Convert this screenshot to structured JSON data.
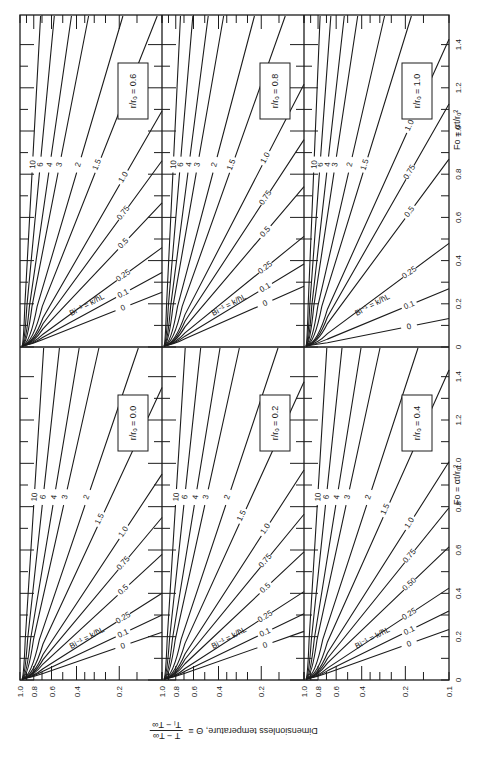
{
  "chart_data": {
    "type": "line",
    "xlabel": "Fo = αt/rₒ²",
    "ylabel": "Dimensionless temperature, Θ ≡ (T − T∞)/(Tᵢ − T∞)",
    "x_axis": {
      "label": "Fo = αt/rₒ²",
      "range": [
        0,
        1.4
      ],
      "ticks": [
        "0",
        "0.2",
        "0.4",
        "0.6",
        "0.8",
        "1.0",
        "1.2",
        "1.4"
      ]
    },
    "y_axis": {
      "label": "Dimensionless temperature, Θ",
      "scale": "log",
      "range": [
        0.1,
        1.0
      ],
      "ticks": [
        "1.0",
        "0.8",
        "0.6",
        "0.4",
        "0.2",
        "0.1"
      ]
    },
    "curve_family_label": "Bi⁻¹ = k/h̄L",
    "curve_labels": [
      "0",
      "0.1",
      "0.25",
      "0.5",
      "0.75",
      "1.0",
      "1.5",
      "2",
      "3",
      "4",
      "6",
      "10"
    ],
    "panels": [
      {
        "position": "top-left",
        "r_ro": "0.6",
        "box_label": "r/rₒ = 0.6"
      },
      {
        "position": "top-middle",
        "r_ro": "0.8",
        "box_label": "r/rₒ = 0.8"
      },
      {
        "position": "top-right",
        "r_ro": "1.0",
        "box_label": "r/rₒ = 1.0"
      },
      {
        "position": "bottom-left",
        "r_ro": "0.0",
        "box_label": "r/rₒ = 0.0"
      },
      {
        "position": "bottom-middle",
        "r_ro": "0.2",
        "box_label": "r/rₒ = 0.2"
      },
      {
        "position": "bottom-right",
        "r_ro": "0.4",
        "box_label": "r/rₒ = 0.4",
        "curve_labels_override": [
          "0",
          "0.1",
          "0.25",
          "0.50",
          "0.75",
          "1.0",
          "1.5",
          "2",
          "3",
          "4",
          "6",
          "10"
        ]
      }
    ],
    "series_fo_at_theta_0_1_estimate": {
      "note": "Approximate Fo where each curve exits panel (read from chart)",
      "r_ro_0.0": {
        "0": 0.22,
        "0.1": 0.3,
        "0.25": 0.4,
        "0.5": 0.58,
        "0.75": 0.75,
        "1.0": 0.95
      }
    },
    "grid": false,
    "legend": "inline labels on curves"
  },
  "labels": {
    "fo_axis_title": "Fo = αt/rₒ²",
    "theta_axis_title": "Dimensionless temperature, Θ ≡",
    "theta_fraction_num": "T − T∞",
    "theta_fraction_den": "Tᵢ − T∞",
    "bi_label": "Bi⁻¹ = k/h̄L",
    "r_symbol": "r",
    "ro_symbol": "rₒ"
  }
}
